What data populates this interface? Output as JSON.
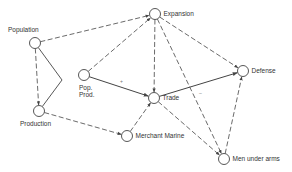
{
  "diagram": {
    "style": {
      "line_color": "#444444",
      "node_fill": "#ffffff",
      "background": "#ffffff"
    },
    "nodes": [
      {
        "id": "expansion",
        "label": "Expansion",
        "x": 155,
        "y": 14,
        "label_pos": "right"
      },
      {
        "id": "population",
        "label": "Population",
        "x": 35,
        "y": 43,
        "label_pos": "top"
      },
      {
        "id": "pop_prod",
        "label": "Pop.\nProd.",
        "line1": "Pop.",
        "line2": "Prod.",
        "x": 84,
        "y": 75,
        "label_pos": "below-right"
      },
      {
        "id": "trade",
        "label": "Trade",
        "x": 154,
        "y": 98,
        "label_pos": "right"
      },
      {
        "id": "defense",
        "label": "Defense",
        "x": 243,
        "y": 71,
        "label_pos": "right"
      },
      {
        "id": "production",
        "label": "Production",
        "x": 39,
        "y": 111,
        "label_pos": "bottom"
      },
      {
        "id": "merchant_marine",
        "label": "Merchant Marine",
        "x": 127,
        "y": 136,
        "label_pos": "right"
      },
      {
        "id": "men_under_arms",
        "label": "Men under arms",
        "x": 224,
        "y": 159,
        "label_pos": "right"
      }
    ],
    "edges": [
      {
        "from": "population",
        "to": "expansion",
        "style": "dashed",
        "arrow": true
      },
      {
        "from": "population",
        "to": "production",
        "style": "dashed",
        "arrow": true
      },
      {
        "from": "population",
        "to": "production",
        "style": "solid-bent",
        "arrow": false,
        "via": [
          62,
          80
        ]
      },
      {
        "from": "pop_prod",
        "to": "expansion",
        "style": "dashed",
        "arrow": true
      },
      {
        "from": "pop_prod",
        "to": "trade",
        "style": "solid",
        "arrow": true
      },
      {
        "from": "expansion",
        "to": "trade",
        "style": "dashed",
        "arrow": true
      },
      {
        "from": "expansion",
        "to": "defense",
        "style": "dashed",
        "arrow": true
      },
      {
        "from": "expansion",
        "to": "men_under_arms",
        "style": "dashed",
        "arrow": true
      },
      {
        "from": "trade",
        "to": "defense",
        "style": "solid",
        "arrow": true
      },
      {
        "from": "trade",
        "to": "men_under_arms",
        "style": "dashed",
        "arrow": true
      },
      {
        "from": "production",
        "to": "merchant_marine",
        "style": "dashed",
        "arrow": true
      },
      {
        "from": "merchant_marine",
        "to": "trade",
        "style": "dashed",
        "arrow": true
      },
      {
        "from": "men_under_arms",
        "to": "defense",
        "style": "dashed",
        "arrow": true
      }
    ],
    "marks": [
      {
        "symbol": "+",
        "x": 120,
        "y": 83
      },
      {
        "symbol": "–",
        "x": 199,
        "y": 95
      }
    ]
  }
}
